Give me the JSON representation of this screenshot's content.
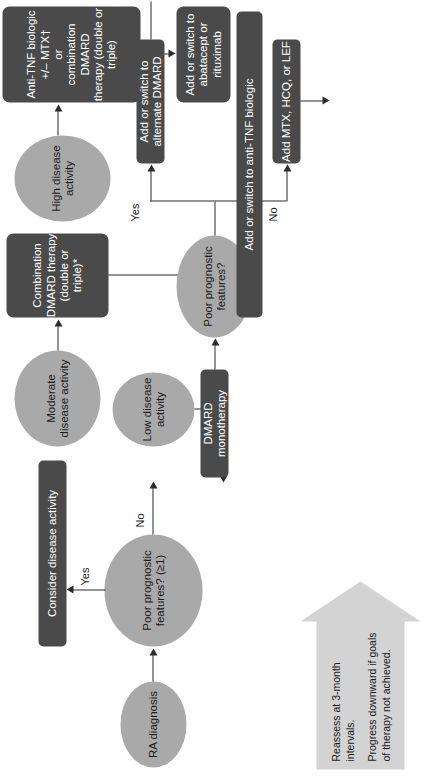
{
  "figure": {
    "orientation": "page rotated 90 degrees counter-clockwise",
    "colors": {
      "oval_fill": "#a9a9a9",
      "box_fill": "#4a4a4a",
      "box_text": "#ffffff",
      "note_fill": "#d3d3d3",
      "connector": "#2b2b2b",
      "background": "#ffffff"
    }
  },
  "note": {
    "name": "reassess-note",
    "lines": [
      "Reassess at 3-month intervals.",
      "Progress downward if goals of therapy not achieved."
    ],
    "line1": "Reassess at\n3-month\nintervals.",
    "line2": "Progress\ndownward\nif goals of\ntherapy\nnot\nachieved."
  },
  "nodes": {
    "ra_diagnosis": "RA diagnosis",
    "poor_prognostic_1": "Poor prognostic\nfeatures? (≥1)",
    "consider_disease_activity": "Consider disease activity",
    "low_disease_activity": "Low disease\nactivity",
    "moderate_disease_activity": "Moderate\ndisease activity",
    "high_disease_activity": "High disease\nactivity",
    "combination_dmard": "Combination\nDMARD therapy\n(double or triple)*",
    "antitnf_or_combination": "Anti-TNF biologic +/– MTX†\nor\ncombination DMARD\ntherapy (double or triple)",
    "add_switch_abatacept": "Add or switch to\nabatacept or rituximab",
    "dmard_monotherapy": "DMARD monotherapy",
    "poor_prognostic_2": "Poor prognostic features?",
    "add_mtx_hcq_lef": "Add MTX, HCQ, or LEF",
    "add_switch_alternate_dmard": "Add or switch to alternate DMARD",
    "add_switch_antitnf": "Add or switch to anti-TNF biologic"
  },
  "edge_labels": {
    "yes_top": "Yes",
    "no_top": "No",
    "yes_bottom": "Yes",
    "no_bottom": "No"
  }
}
